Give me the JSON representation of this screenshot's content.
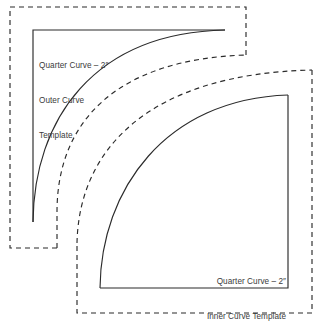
{
  "document": {
    "title": "Quarter Curve Templates",
    "background_color": "#ffffff",
    "line_color": "#2b2b2b",
    "text_color": "#3b3b3b"
  },
  "templates": {
    "outer": {
      "label_lines": [
        "Quarter Curve – 2″",
        "Outer Curve",
        "Template"
      ],
      "line1": "Quarter Curve – 2″",
      "line2": "Outer Curve",
      "line3": "Template",
      "cut_line_style": "solid",
      "seam_line_style": "dashed",
      "size": "2″"
    },
    "inner": {
      "label_lines": [
        "Quarter Curve – 2″",
        "Inner Curve Template"
      ],
      "line1": "Quarter Curve – 2″",
      "line2": "Inner Curve Template",
      "cut_line_style": "solid",
      "seam_line_style": "dashed",
      "size": "2″"
    }
  }
}
